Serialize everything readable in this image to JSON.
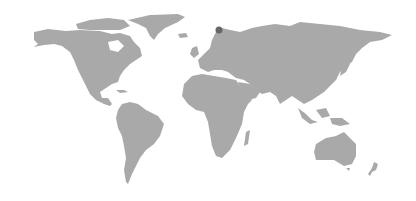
{
  "map": {
    "type": "world-map",
    "projection": "miller",
    "land_color": "#a9a9a9",
    "background_color": "#ffffff",
    "regions": [
      "North America",
      "Greenland",
      "South America",
      "Europe",
      "Africa",
      "Asia",
      "Australia",
      "New Zealand"
    ],
    "markers": [
      {
        "name": "location-marker",
        "x": 219,
        "y": 30,
        "radius": 3.5,
        "color": "#666666"
      }
    ]
  }
}
